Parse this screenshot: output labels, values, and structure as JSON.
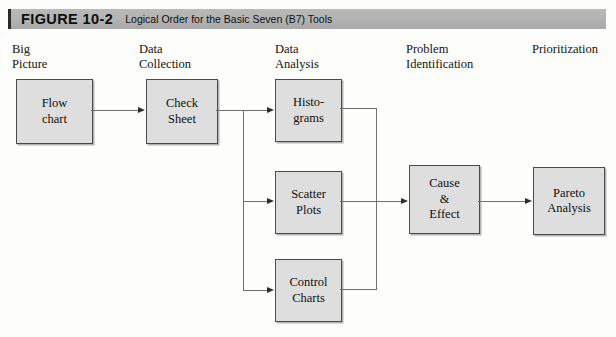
{
  "figure": {
    "number": "FIGURE 10-2",
    "caption": "Logical Order for the Basic Seven (B7) Tools"
  },
  "stages": [
    {
      "name": "big-picture",
      "label": "Big\nPicture"
    },
    {
      "name": "data-collection",
      "label": "Data\nCollection"
    },
    {
      "name": "data-analysis",
      "label": "Data\nAnalysis"
    },
    {
      "name": "problem-identification",
      "label": "Problem\nIdentification"
    },
    {
      "name": "prioritization",
      "label": "Prioritization"
    }
  ],
  "nodes": [
    {
      "name": "flow-chart",
      "label": "Flow\nchart"
    },
    {
      "name": "check-sheet",
      "label": "Check\nSheet"
    },
    {
      "name": "histograms",
      "label": "Histo-\ngrams"
    },
    {
      "name": "scatter-plots",
      "label": "Scatter\nPlots"
    },
    {
      "name": "control-charts",
      "label": "Control\nCharts"
    },
    {
      "name": "cause-effect",
      "label": "Cause\n&\nEffect"
    },
    {
      "name": "pareto-analysis",
      "label": "Pareto\nAnalysis"
    }
  ],
  "colors": {
    "node_fill": "#dedede",
    "node_border": "#4a4a4a",
    "banner_fill": "#b3b3b3",
    "connector": "#6f6f6f",
    "page_background": "#fdfdfc"
  }
}
